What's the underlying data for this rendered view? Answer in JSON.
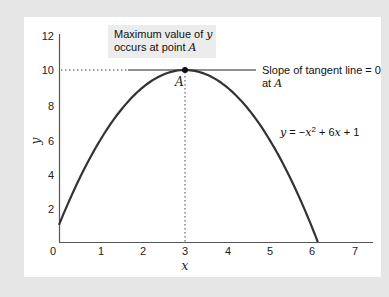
{
  "chart_data": {
    "type": "line",
    "title": "",
    "xlabel": "x",
    "ylabel": "y",
    "xlim": [
      0,
      7
    ],
    "ylim": [
      0,
      12
    ],
    "x_ticks": [
      "0",
      "1",
      "2",
      "3",
      "4",
      "5",
      "6",
      "7"
    ],
    "y_ticks": [
      "2",
      "4",
      "6",
      "8",
      "10",
      "12"
    ],
    "grid": false,
    "series": [
      {
        "name": "y = -x^2 + 6x + 1",
        "function": "y = -x^2 + 6x + 1",
        "x": [
          0,
          0.5,
          1,
          1.5,
          2,
          2.5,
          3,
          3.5,
          4,
          4.5,
          5,
          5.5,
          6,
          6.16
        ],
        "values": [
          1,
          3.75,
          6,
          7.75,
          9,
          9.75,
          10,
          9.75,
          9,
          7.75,
          6,
          3.75,
          1,
          0
        ]
      }
    ],
    "point": {
      "label": "A",
      "x": 3,
      "y": 10
    },
    "tangent_line": {
      "y": 10,
      "x_from": 1.65,
      "x_to": 4.7
    },
    "annotations": [
      {
        "text_line1": "Maximum value of y",
        "text_line2": "occurs at point A"
      },
      {
        "text_line1": "Slope of tangent line = 0",
        "text_line2": "at A"
      },
      {
        "text": "y = −x² + 6x + 1"
      }
    ]
  },
  "labels": {
    "xlabel": "x",
    "ylabel": "y",
    "point": "A",
    "max_box_l1_a": "Maximum value of ",
    "max_box_l1_b": "y",
    "max_box_l2_a": "occurs at point ",
    "max_box_l2_b": "A",
    "slope_l1": "Slope of tangent line = 0",
    "slope_l2_a": "at ",
    "slope_l2_b": "A",
    "eq_y": "y",
    "eq_mid": " = −",
    "eq_x": "x",
    "eq_sup": "2",
    "eq_rest_a": " + 6",
    "eq_x2": "x",
    "eq_rest_b": " + 1"
  },
  "colors": {
    "background": "#e6e6e6",
    "panel": "#ffffff",
    "curve": "#333333",
    "annotation_box": "#eeeeee"
  }
}
